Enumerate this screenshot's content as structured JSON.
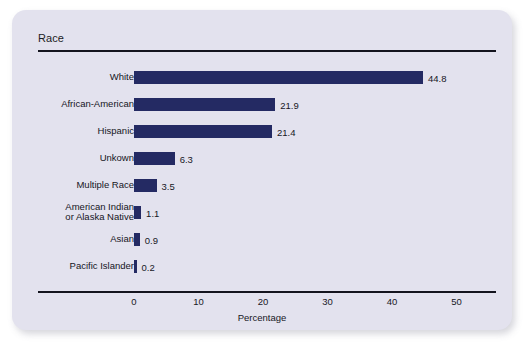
{
  "card": {
    "title": "Race",
    "background_color": "#e3e2ee",
    "page_background_color": "#ffffff"
  },
  "chart_data": {
    "type": "bar",
    "orientation": "horizontal",
    "title": "Race",
    "xlabel": "Percentage",
    "ylabel": "",
    "xlim": [
      0,
      53
    ],
    "xticks": [
      0,
      10,
      20,
      30,
      40,
      50
    ],
    "xtick_labels": [
      "0",
      "10",
      "20",
      "30",
      "40",
      "50"
    ],
    "grid": false,
    "legend": null,
    "bar_color": "#242a63",
    "categories": [
      "White",
      "African-American",
      "Hispanic",
      "Unkown",
      "Multiple Race",
      "American Indian\nor Alaska Native",
      "Asian",
      "Pacific Islander"
    ],
    "values": [
      44.8,
      21.9,
      21.4,
      6.3,
      3.5,
      1.1,
      0.9,
      0.2
    ],
    "value_labels": [
      "44.8",
      "21.9",
      "21.4",
      "6.3",
      "3.5",
      "1.1",
      "0.9",
      "0.2"
    ]
  }
}
